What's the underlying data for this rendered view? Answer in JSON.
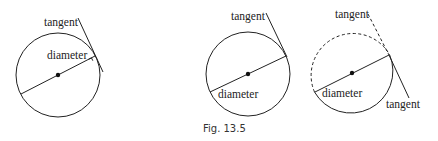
{
  "figure": {
    "caption": "Fig. 13.5",
    "panels": [
      {
        "id": "panel-1",
        "labels": {
          "tangent": "tangent",
          "diameter": "diameter"
        },
        "circle": {
          "cx": 58,
          "cy": 75,
          "r": 42,
          "style": "solid"
        },
        "right_angle_marker": true
      },
      {
        "id": "panel-2",
        "labels": {
          "tangent": "tangent",
          "diameter": "diameter"
        },
        "circle": {
          "cx": 248,
          "cy": 74,
          "r": 42,
          "style": "solid"
        }
      },
      {
        "id": "panel-3",
        "labels": {
          "tangent_top": "tangent",
          "diameter": "diameter",
          "tangent_bottom": "tangent"
        },
        "circle": {
          "cx": 352,
          "cy": 73,
          "r": 42,
          "style": "half-dashed"
        }
      }
    ]
  },
  "colors": {
    "line": "#222222",
    "background": "#ffffff"
  }
}
